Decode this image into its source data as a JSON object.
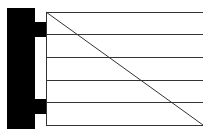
{
  "diagram": {
    "colors": {
      "fill": "#000000",
      "stroke": "#333333",
      "background": "#ffffff"
    },
    "bar": {
      "x": 7,
      "y": 8,
      "width": 28,
      "height": 121
    },
    "tabs": [
      {
        "x": 34,
        "y": 22,
        "width": 12,
        "height": 15
      },
      {
        "x": 34,
        "y": 99,
        "width": 12,
        "height": 15
      }
    ],
    "frame": {
      "x": 46,
      "y": 12,
      "width": 157,
      "height": 113
    },
    "horizontal_lines_y": [
      12,
      34.6,
      57.2,
      79.8,
      102.4,
      125
    ],
    "diagonal": {
      "x1": 46,
      "y1": 12,
      "x2": 203,
      "y2": 125
    }
  }
}
